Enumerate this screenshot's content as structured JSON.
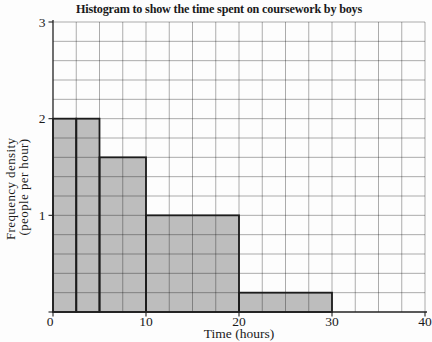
{
  "chart_data": {
    "type": "bar",
    "subtype": "histogram",
    "title": "Histogram to show the time spent on coursework by boys",
    "xlabel": "Time (hours)",
    "ylabel": "Frequency density (people per hour)",
    "ylabel_lines": [
      "Frequency density",
      "(people per hour)"
    ],
    "xlim": [
      0,
      40
    ],
    "ylim": [
      0,
      3
    ],
    "x_ticks": [
      0,
      10,
      20,
      30,
      40
    ],
    "y_ticks": [
      0,
      1,
      2,
      3
    ],
    "grid": {
      "on": true,
      "x_step": 2.5,
      "y_step": 0.2
    },
    "legend": "none",
    "bars": [
      {
        "interval": [
          0,
          2.5
        ],
        "frequency_density": 2
      },
      {
        "interval": [
          2.5,
          5
        ],
        "frequency_density": 2
      },
      {
        "interval": [
          5,
          10
        ],
        "frequency_density": 1.6
      },
      {
        "interval": [
          10,
          20
        ],
        "frequency_density": 1
      },
      {
        "interval": [
          20,
          30
        ],
        "frequency_density": 0.2
      }
    ],
    "colors": {
      "bar_fill": "#bdbdbd",
      "bar_outline": "#1c1c1c",
      "grid_line": "rgba(0,0,0,0.36)",
      "axis": "#222222",
      "text": "#1a1a1a",
      "background": "#fdfdfd"
    }
  }
}
